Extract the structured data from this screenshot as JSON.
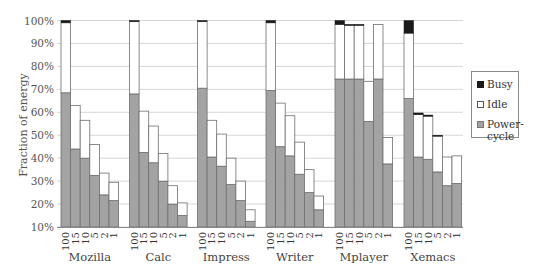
{
  "chart_data": {
    "type": "bar",
    "stacked": true,
    "title": "",
    "xlabel": "",
    "ylabel": "Fraction of energy",
    "ylim": [
      10,
      100
    ],
    "yticks": [
      "10%",
      "20%",
      "30%",
      "40%",
      "50%",
      "60%",
      "70%",
      "80%",
      "90%",
      "100%"
    ],
    "grid": true,
    "legend_position": "right",
    "legend": [
      {
        "name": "Busy",
        "color": "#1a1a1a"
      },
      {
        "name": "Idle",
        "color": "#ffffff"
      },
      {
        "name": "Power-\ncycle",
        "color": "#a3a3a3"
      }
    ],
    "sub_categories": [
      "100",
      "15",
      "10",
      "5",
      "2",
      "1"
    ],
    "groups": [
      {
        "name": "Mozilla",
        "power_cycle": [
          68.5,
          44,
          40,
          32.5,
          24,
          21.5
        ],
        "idle_top": [
          99,
          63,
          56.5,
          46,
          33.5,
          29.5
        ],
        "busy_top": [
          100,
          63,
          56.5,
          46,
          33.5,
          29.5
        ]
      },
      {
        "name": "Calc",
        "power_cycle": [
          68,
          42.5,
          38,
          30,
          20,
          15
        ],
        "idle_top": [
          99.5,
          60.5,
          54,
          42,
          28,
          20.5
        ],
        "busy_top": [
          100,
          60.5,
          54,
          42,
          28,
          20.5
        ]
      },
      {
        "name": "Impress",
        "power_cycle": [
          70.5,
          40.5,
          36.5,
          28.5,
          21.5,
          12.5
        ],
        "idle_top": [
          99.5,
          56.5,
          50.5,
          40,
          30,
          17.5
        ],
        "busy_top": [
          100,
          56.5,
          50.5,
          40,
          30,
          17.5
        ]
      },
      {
        "name": "Writer",
        "power_cycle": [
          69.5,
          45,
          41,
          33,
          25,
          17.5
        ],
        "idle_top": [
          99,
          64,
          58.5,
          47,
          35,
          23.5
        ],
        "busy_top": [
          100,
          64,
          58.5,
          47,
          35,
          23.5
        ]
      },
      {
        "name": "Mplayer",
        "power_cycle": [
          74.5,
          74.5,
          74.5,
          56,
          74.5,
          37.5
        ],
        "idle_top": [
          98.3,
          98,
          98,
          73.5,
          98.3,
          49
        ],
        "busy_top": [
          100,
          98.3,
          98.3,
          73.5,
          98.3,
          49
        ]
      },
      {
        "name": "Xemacs",
        "power_cycle": [
          66,
          40.5,
          39.5,
          34,
          28,
          29
        ],
        "idle_top": [
          94.5,
          59,
          58.3,
          49.7,
          40.5,
          41
        ],
        "busy_top": [
          100,
          59.7,
          58.8,
          50,
          40.5,
          41
        ]
      }
    ]
  }
}
